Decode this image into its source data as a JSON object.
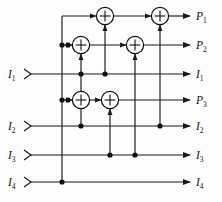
{
  "diagram": {
    "type": "logic-circuit",
    "colors": {
      "wire": "#1a1a1a",
      "node": "#111111",
      "background": "#fdfdfd",
      "adder_fill": "#ffffff"
    },
    "inputs": [
      {
        "id": "in-1",
        "base": "I",
        "sub": "1",
        "y": 74
      },
      {
        "id": "in-2",
        "base": "I",
        "sub": "2",
        "y": 126
      },
      {
        "id": "in-3",
        "base": "I",
        "sub": "3",
        "y": 155
      },
      {
        "id": "in-4",
        "base": "I",
        "sub": "4",
        "y": 182
      }
    ],
    "outputs": [
      {
        "id": "out-p1",
        "base": "P",
        "sub": "1",
        "y": 16
      },
      {
        "id": "out-p2",
        "base": "P",
        "sub": "2",
        "y": 45
      },
      {
        "id": "out-i1",
        "base": "I",
        "sub": "1",
        "y": 74
      },
      {
        "id": "out-p3",
        "base": "P",
        "sub": "3",
        "y": 100
      },
      {
        "id": "out-i2",
        "base": "I",
        "sub": "2",
        "y": 126
      },
      {
        "id": "out-i3",
        "base": "I",
        "sub": "3",
        "y": 155
      },
      {
        "id": "out-i4",
        "base": "I",
        "sub": "4",
        "y": 182
      }
    ],
    "adders": [
      {
        "id": "adder-p1-a",
        "symbol": "+",
        "cx": 105,
        "cy": 16,
        "r": 9
      },
      {
        "id": "adder-p1-b",
        "symbol": "+",
        "cx": 160,
        "cy": 16,
        "r": 9
      },
      {
        "id": "adder-p2-a",
        "symbol": "+",
        "cx": 81,
        "cy": 45,
        "r": 9
      },
      {
        "id": "adder-p2-b",
        "symbol": "+",
        "cx": 135,
        "cy": 45,
        "r": 9
      },
      {
        "id": "adder-p3-a",
        "symbol": "+",
        "cx": 81,
        "cy": 100,
        "r": 9
      },
      {
        "id": "adder-p3-b",
        "symbol": "+",
        "cx": 110,
        "cy": 100,
        "r": 9
      }
    ],
    "junction_nodes": [
      {
        "id": "node-p1-feed",
        "cx": 62,
        "cy": 45
      },
      {
        "id": "node-p2-feed",
        "cx": 68,
        "cy": 45
      },
      {
        "id": "node-i1-tap-a",
        "cx": 81,
        "cy": 74
      },
      {
        "id": "node-i1-tap-b",
        "cx": 105,
        "cy": 74
      },
      {
        "id": "node-p3-feed-a",
        "cx": 62,
        "cy": 100
      },
      {
        "id": "node-p3-feed-b",
        "cx": 68,
        "cy": 100
      },
      {
        "id": "node-i2-tap-a",
        "cx": 81,
        "cy": 126
      },
      {
        "id": "node-i2-tap-b",
        "cx": 160,
        "cy": 126
      },
      {
        "id": "node-i3-tap-a",
        "cx": 110,
        "cy": 155
      },
      {
        "id": "node-i3-tap-b",
        "cx": 135,
        "cy": 155
      },
      {
        "id": "node-i4-tap",
        "cx": 62,
        "cy": 182
      }
    ],
    "verticals": [
      {
        "id": "v-i4-to-p1",
        "x": 62,
        "y1": 16,
        "y2": 182
      },
      {
        "id": "v-i1-to-p2",
        "x": 81,
        "y1": 45,
        "y2": 126
      },
      {
        "id": "v-i3-to-p1",
        "x": 105,
        "y1": 16,
        "y2": 74
      },
      {
        "id": "v-i3-to-p3",
        "x": 110,
        "y1": 100,
        "y2": 155
      },
      {
        "id": "v-i3-to-p2",
        "x": 135,
        "y1": 45,
        "y2": 155
      },
      {
        "id": "v-i2-to-p1",
        "x": 160,
        "y1": 16,
        "y2": 126
      }
    ]
  }
}
